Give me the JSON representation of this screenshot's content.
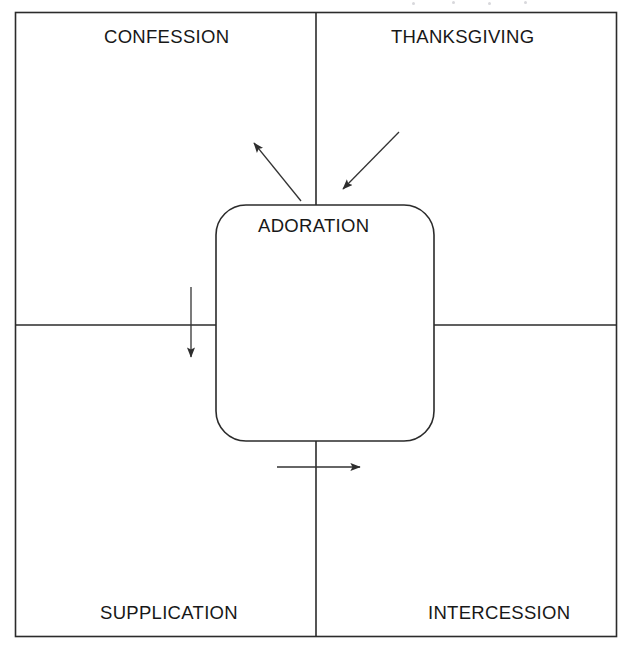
{
  "diagram": {
    "title_text_center": "ADORATION",
    "quadrants": [
      {
        "id": "top-left",
        "label": "CONFESSION"
      },
      {
        "id": "top-right",
        "label": "THANKSGIVING"
      },
      {
        "id": "bottom-left",
        "label": "SUPPLICATION"
      },
      {
        "id": "bottom-right",
        "label": "INTERCESSION"
      }
    ],
    "center_node": {
      "label": "ADORATION",
      "shape": "rounded-rectangle",
      "x": 216,
      "y": 205,
      "width": 218,
      "height": 236,
      "corner_radius": 30
    },
    "frame": {
      "x": 15,
      "y": 12,
      "width": 602,
      "height": 625,
      "vertical_divider_x": 316,
      "horizontal_divider_y": 325
    },
    "arrows": [
      {
        "id": "arrow-to-confession",
        "direction": "up-left",
        "from_label": "ADORATION",
        "to_label": "CONFESSION",
        "x1": 301,
        "y1": 201,
        "x2": 252,
        "y2": 141
      },
      {
        "id": "arrow-from-thanksgiving",
        "direction": "down-left",
        "from_label": "THANKSGIVING",
        "to_label": "ADORATION",
        "x1": 399,
        "y1": 132,
        "x2": 341,
        "y2": 191
      },
      {
        "id": "arrow-to-supplication",
        "direction": "down",
        "from_label": "ADORATION",
        "to_label": "SUPPLICATION",
        "x1": 191,
        "y1": 287,
        "x2": 191,
        "y2": 361
      },
      {
        "id": "arrow-to-intercession",
        "direction": "right",
        "from_label": "ADORATION",
        "to_label": "INTERCESSION",
        "x1": 277,
        "y1": 467,
        "x2": 364,
        "y2": 467
      }
    ],
    "colors": {
      "stroke": "#2b2b2b",
      "arrow": "#333333",
      "text": "#181818",
      "background": "#ffffff"
    }
  }
}
